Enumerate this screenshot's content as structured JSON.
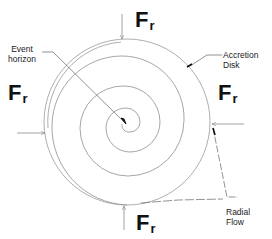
{
  "diagram": {
    "labels": {
      "event_horizon_line1": "Event",
      "event_horizon_line2": "horizon",
      "accretion_line1": "Accretion",
      "accretion_line2": "Disk",
      "radial_line1": "Radial",
      "radial_line2": "Flow"
    },
    "forces": [
      {
        "position": "top",
        "symbol": "F",
        "subscript": "r"
      },
      {
        "position": "left",
        "symbol": "F",
        "subscript": "r"
      },
      {
        "position": "right",
        "symbol": "F",
        "subscript": "r"
      },
      {
        "position": "bottom",
        "symbol": "F",
        "subscript": "r"
      }
    ],
    "colors": {
      "line": "#8a8a8a",
      "text": "#222222"
    }
  }
}
